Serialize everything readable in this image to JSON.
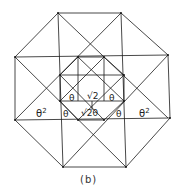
{
  "figure": {
    "caption": "(b)",
    "labels": {
      "theta_sq_left": "θ",
      "theta_sq_left_exp": "2",
      "theta_sq_right": "θ",
      "theta_sq_right_exp": "2",
      "theta_upper_left": "θ",
      "sqrt2_top": "√2",
      "theta_upper_right": "θ",
      "theta_lower_left": "θ",
      "sqrt2_theta_bottom": "√2θ",
      "theta_lower_right": "θ"
    },
    "colors": {
      "line": "#1a1a1a",
      "background": "#ffffff"
    }
  }
}
